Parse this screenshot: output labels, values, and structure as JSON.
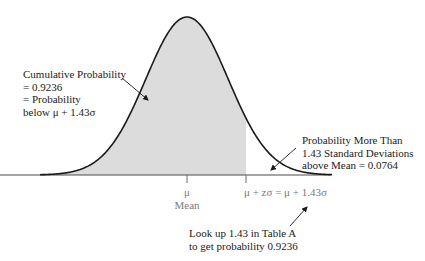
{
  "diagram": {
    "type": "normal-distribution",
    "colors": {
      "curve": "#1a1a1a",
      "shade": "#dcdcdc",
      "axis": "#4a4a4a",
      "text": "#1a1a1a",
      "axis_label_text": "#7a7a7a"
    },
    "left_annotation": {
      "lines": [
        "Cumulative Probability",
        "= 0.9236",
        "= Probability",
        "below μ + 1.43σ"
      ]
    },
    "right_annotation": {
      "lines": [
        "Probability More Than",
        "1.43 Standard Deviations",
        "above Mean = 0.0764"
      ]
    },
    "bottom_annotation": {
      "lines": [
        "Look up 1.43 in Table A",
        "to get probability 0.9236"
      ]
    },
    "axis_labels": {
      "mean_symbol": "μ",
      "mean_word": "Mean",
      "cutoff": "μ + zσ = μ + 1.43σ"
    },
    "values": {
      "z": 1.43,
      "cumulative_probability": 0.9236,
      "upper_tail_probability": 0.0764
    }
  }
}
